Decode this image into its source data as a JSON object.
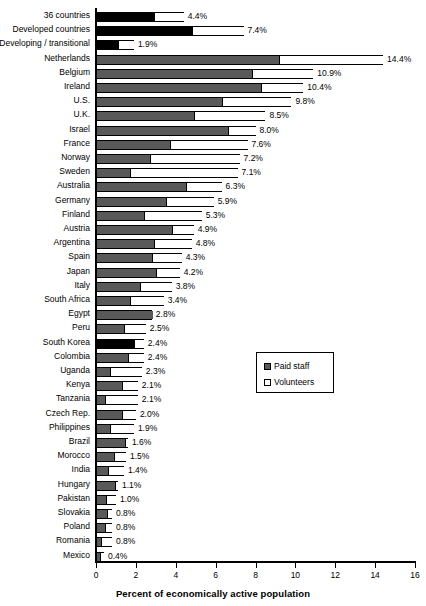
{
  "chart_data": {
    "type": "bar",
    "orientation": "horizontal",
    "stacked": true,
    "title": "",
    "xlabel": "Percent of economically active population",
    "ylabel": "",
    "xlim": [
      0,
      16
    ],
    "xticks": [
      0,
      2,
      4,
      6,
      8,
      10,
      12,
      14,
      16
    ],
    "grid": false,
    "legend_position": "center-right",
    "legend": [
      {
        "name": "Paid staff",
        "color": "#595959"
      },
      {
        "name": "Volunteers",
        "color": "#ffffff"
      }
    ],
    "series": [
      {
        "name": "Paid staff",
        "color": "#595959"
      },
      {
        "name": "Volunteers",
        "color": "#ffffff"
      }
    ],
    "categories": [
      "36 countries",
      "Developed countries",
      "Developing / transitional",
      "Netherlands",
      "Belgium",
      "Ireland",
      "U.S.",
      "U.K.",
      "Israel",
      "France",
      "Norway",
      "Sweden",
      "Australia",
      "Germany",
      "Finland",
      "Austria",
      "Argentina",
      "Spain",
      "Japan",
      "Italy",
      "South Africa",
      "Egypt",
      "Peru",
      "South Korea",
      "Colombia",
      "Uganda",
      "Kenya",
      "Tanzania",
      "Czech Rep.",
      "Philippines",
      "Brazil",
      "Morocco",
      "India",
      "Hungary",
      "Pakistan",
      "Slovakia",
      "Poland",
      "Romania",
      "Mexico"
    ],
    "rows": [
      {
        "category": "36 countries",
        "paid": 2.9,
        "volunteers": 1.5,
        "total": 4.4,
        "label": "4.4%",
        "highlight": true
      },
      {
        "category": "Developed countries",
        "paid": 4.8,
        "volunteers": 2.6,
        "total": 7.4,
        "label": "7.4%",
        "highlight": true
      },
      {
        "category": "Developing / transitional",
        "paid": 1.1,
        "volunteers": 0.8,
        "total": 1.9,
        "label": "1.9%",
        "highlight": true
      },
      {
        "category": "Netherlands",
        "paid": 9.2,
        "volunteers": 5.2,
        "total": 14.4,
        "label": "14.4%",
        "highlight": false
      },
      {
        "category": "Belgium",
        "paid": 7.8,
        "volunteers": 3.1,
        "total": 10.9,
        "label": "10.9%",
        "highlight": false
      },
      {
        "category": "Ireland",
        "paid": 8.3,
        "volunteers": 2.1,
        "total": 10.4,
        "label": "10.4%",
        "highlight": false
      },
      {
        "category": "U.S.",
        "paid": 6.3,
        "volunteers": 3.5,
        "total": 9.8,
        "label": "9.8%",
        "highlight": false
      },
      {
        "category": "U.K.",
        "paid": 4.9,
        "volunteers": 3.6,
        "total": 8.5,
        "label": "8.5%",
        "highlight": false
      },
      {
        "category": "Israel",
        "paid": 6.6,
        "volunteers": 1.4,
        "total": 8.0,
        "label": "8.0%",
        "highlight": false
      },
      {
        "category": "France",
        "paid": 3.7,
        "volunteers": 3.9,
        "total": 7.6,
        "label": "7.6%",
        "highlight": false
      },
      {
        "category": "Norway",
        "paid": 2.7,
        "volunteers": 4.5,
        "total": 7.2,
        "label": "7.2%",
        "highlight": false
      },
      {
        "category": "Sweden",
        "paid": 1.7,
        "volunteers": 5.4,
        "total": 7.1,
        "label": "7.1%",
        "highlight": false
      },
      {
        "category": "Australia",
        "paid": 4.5,
        "volunteers": 1.8,
        "total": 6.3,
        "label": "6.3%",
        "highlight": false
      },
      {
        "category": "Germany",
        "paid": 3.5,
        "volunteers": 2.4,
        "total": 5.9,
        "label": "5.9%",
        "highlight": false
      },
      {
        "category": "Finland",
        "paid": 2.4,
        "volunteers": 2.9,
        "total": 5.3,
        "label": "5.3%",
        "highlight": false
      },
      {
        "category": "Austria",
        "paid": 3.8,
        "volunteers": 1.1,
        "total": 4.9,
        "label": "4.9%",
        "highlight": false
      },
      {
        "category": "Argentina",
        "paid": 2.9,
        "volunteers": 1.9,
        "total": 4.8,
        "label": "4.8%",
        "highlight": false
      },
      {
        "category": "Spain",
        "paid": 2.8,
        "volunteers": 1.5,
        "total": 4.3,
        "label": "4.3%",
        "highlight": false
      },
      {
        "category": "Japan",
        "paid": 3.0,
        "volunteers": 1.2,
        "total": 4.2,
        "label": "4.2%",
        "highlight": false
      },
      {
        "category": "Italy",
        "paid": 2.2,
        "volunteers": 1.6,
        "total": 3.8,
        "label": "3.8%",
        "highlight": false
      },
      {
        "category": "South Africa",
        "paid": 1.7,
        "volunteers": 1.7,
        "total": 3.4,
        "label": "3.4%",
        "highlight": false
      },
      {
        "category": "Egypt",
        "paid": 2.8,
        "volunteers": 0.0,
        "total": 2.8,
        "label": "2.8%",
        "highlight": false
      },
      {
        "category": "Peru",
        "paid": 1.4,
        "volunteers": 1.1,
        "total": 2.5,
        "label": "2.5%",
        "highlight": false
      },
      {
        "category": "South Korea",
        "paid": 1.9,
        "volunteers": 0.5,
        "total": 2.4,
        "label": "2.4%",
        "highlight": true
      },
      {
        "category": "Colombia",
        "paid": 1.6,
        "volunteers": 0.8,
        "total": 2.4,
        "label": "2.4%",
        "highlight": false
      },
      {
        "category": "Uganda",
        "paid": 0.7,
        "volunteers": 1.6,
        "total": 2.3,
        "label": "2.3%",
        "highlight": false
      },
      {
        "category": "Kenya",
        "paid": 1.3,
        "volunteers": 0.8,
        "total": 2.1,
        "label": "2.1%",
        "highlight": false
      },
      {
        "category": "Tanzania",
        "paid": 0.45,
        "volunteers": 1.65,
        "total": 2.1,
        "label": "2.1%",
        "highlight": false
      },
      {
        "category": "Czech Rep.",
        "paid": 1.3,
        "volunteers": 0.7,
        "total": 2.0,
        "label": "2.0%",
        "highlight": false
      },
      {
        "category": "Philippines",
        "paid": 0.7,
        "volunteers": 1.2,
        "total": 1.9,
        "label": "1.9%",
        "highlight": false
      },
      {
        "category": "Brazil",
        "paid": 1.45,
        "volunteers": 0.15,
        "total": 1.6,
        "label": "1.6%",
        "highlight": false
      },
      {
        "category": "Morocco",
        "paid": 0.9,
        "volunteers": 0.6,
        "total": 1.5,
        "label": "1.5%",
        "highlight": false
      },
      {
        "category": "India",
        "paid": 0.6,
        "volunteers": 0.8,
        "total": 1.4,
        "label": "1.4%",
        "highlight": false
      },
      {
        "category": "Hungary",
        "paid": 0.95,
        "volunteers": 0.15,
        "total": 1.1,
        "label": "1.1%",
        "highlight": false
      },
      {
        "category": "Pakistan",
        "paid": 0.5,
        "volunteers": 0.5,
        "total": 1.0,
        "label": "1.0%",
        "highlight": false
      },
      {
        "category": "Slovakia",
        "paid": 0.55,
        "volunteers": 0.25,
        "total": 0.8,
        "label": "0.8%",
        "highlight": false
      },
      {
        "category": "Poland",
        "paid": 0.45,
        "volunteers": 0.35,
        "total": 0.8,
        "label": "0.8%",
        "highlight": false
      },
      {
        "category": "Romania",
        "paid": 0.25,
        "volunteers": 0.55,
        "total": 0.8,
        "label": "0.8%",
        "highlight": false
      },
      {
        "category": "Mexico",
        "paid": 0.2,
        "volunteers": 0.2,
        "total": 0.4,
        "label": "0.4%",
        "highlight": false
      }
    ]
  },
  "axis": {
    "x_title": "Percent of economically active population",
    "tick_labels": [
      "0",
      "2",
      "4",
      "6",
      "8",
      "10",
      "12",
      "14",
      "16"
    ]
  },
  "legend": {
    "paid_label": "Paid staff",
    "volunteers_label": "Volunteers"
  }
}
